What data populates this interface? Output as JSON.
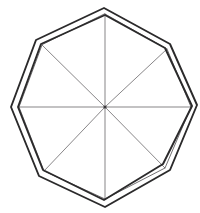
{
  "figure": {
    "background_color": "#ffffff",
    "canvas": {
      "width": 200,
      "height": 213
    },
    "center": {
      "x": 105,
      "y": 107
    },
    "stroke_colors": {
      "outer_polygon": "#2b2a2b",
      "inner_polygon": "#4e4b4e",
      "radii": "#555255",
      "center_dot": "#3a383a"
    },
    "stroke_widths": {
      "outer_polygon": 1.9,
      "inner_polygon": 0.8,
      "radii": 0.7
    },
    "elements": {
      "inner_octagon": {
        "name": "inscribed octagon",
        "sides": 8,
        "closed": true,
        "points": "105,14 167,49 191,107 165,168 105,199 44,171 19,107 42,45"
      },
      "outer_octagon_a": {
        "name": "circumscribed octagon outline (outer trace)",
        "sides": 8,
        "closed": true,
        "points": "104,8 170,44 197,105 170,170 105,207 39,176 11,107 36,40"
      },
      "outer_octagon_b": {
        "name": "circumscribed octagon outline (inner trace of double line)",
        "sides": 8,
        "closed": true,
        "points": "105,15 165,48 192,106 163,164 104,200 43,170 18,107 41,44"
      },
      "radii": {
        "name": "eight radii forming four diameters",
        "count": 8,
        "segments": [
          "105,107 105,14",
          "105,107 167,49",
          "105,107 191,107",
          "105,107 165,168",
          "105,107 105,199",
          "105,107 44,171",
          "105,107 19,107",
          "105,107 42,45"
        ]
      },
      "center_dot": {
        "name": "center point",
        "x": 105,
        "y": 107,
        "r": 1.6
      }
    }
  }
}
